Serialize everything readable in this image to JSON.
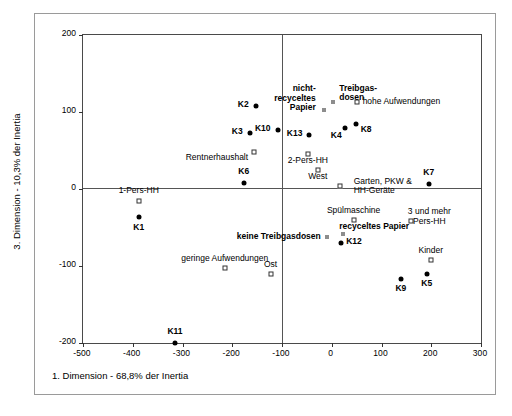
{
  "chart_data": {
    "type": "scatter",
    "title": "",
    "xlabel": "1. Dimension - 68,8% der Inertia",
    "ylabel": "3. Dimension - 10,3% der Inertia",
    "xlim": [
      -500,
      300
    ],
    "ylim": [
      -200,
      200
    ],
    "xticks": [
      -500,
      -400,
      -300,
      -200,
      -100,
      0,
      100,
      200,
      300
    ],
    "yticks": [
      200,
      100,
      0,
      -100,
      -200
    ],
    "xticklabels": [
      "-500",
      "-400",
      "-300",
      "-200",
      "-100",
      "0",
      "100",
      "200",
      "300"
    ],
    "yticklabels": [
      "200",
      "100",
      "0",
      "-100",
      "-200"
    ],
    "grid": false,
    "legend": null,
    "origin_lines": true,
    "series": [
      {
        "name": "Cluster",
        "marker": "filled-circle",
        "points": [
          {
            "label": "K1",
            "x": -388,
            "y": -37
          },
          {
            "label": "K11",
            "x": -315,
            "y": -200
          },
          {
            "label": "K6",
            "x": -177,
            "y": 8
          },
          {
            "label": "K3",
            "x": -165,
            "y": 73
          },
          {
            "label": "K2",
            "x": -153,
            "y": 108
          },
          {
            "label": "K10",
            "x": -109,
            "y": 77
          },
          {
            "label": "K13",
            "x": -45,
            "y": 70
          },
          {
            "label": "K4",
            "x": 26,
            "y": 79
          },
          {
            "label": "K8",
            "x": 48,
            "y": 84
          },
          {
            "label": "K7",
            "x": 195,
            "y": 7
          },
          {
            "label": "K12",
            "x": 19,
            "y": -70
          },
          {
            "label": "K9",
            "x": 139,
            "y": -117
          },
          {
            "label": "K5",
            "x": 191,
            "y": -110
          }
        ]
      },
      {
        "name": "Merkmal",
        "marker": "open-square",
        "points": [
          {
            "label": "1-Pers-HH",
            "x": -388,
            "y": -15
          },
          {
            "label": "Rentnerhaushalt",
            "x": -156,
            "y": 48
          },
          {
            "label": "2-Pers-HH",
            "x": -48,
            "y": 45
          },
          {
            "label": "West",
            "x": -28,
            "y": 25
          },
          {
            "label": "geringe Aufwendungen",
            "x": -215,
            "y": -103
          },
          {
            "label": "Ost",
            "x": -123,
            "y": -110
          },
          {
            "label": "Garten, PKW & HH-Geräte",
            "x": 16,
            "y": 4
          },
          {
            "label": "Spülmaschine",
            "x": 44,
            "y": -40
          },
          {
            "label": "3 und mehr Pers-HH",
            "x": 160,
            "y": -42
          },
          {
            "label": "Kinder",
            "x": 199,
            "y": -92
          },
          {
            "label": "hohe Aufwendungen",
            "x": 50,
            "y": 113
          }
        ]
      },
      {
        "name": "Produkt",
        "marker": "small-gray-square",
        "points": [
          {
            "label": "nicht-recyceltes Papier",
            "x": -16,
            "y": 102
          },
          {
            "label": "Treibgasdosen",
            "x": 3,
            "y": 113
          },
          {
            "label": "keine Treibgasdosen",
            "x": -10,
            "y": -62
          },
          {
            "label": "recyceltes Papier",
            "x": 23,
            "y": -58
          }
        ]
      }
    ]
  },
  "axes": {
    "x_title": "1. Dimension - 68,8% der Inertia",
    "y_title": "3. Dimension - 10,3% der Inertia"
  },
  "labels": {
    "k1": "K1",
    "k2": "K2",
    "k3": "K3",
    "k4": "K4",
    "k5": "K5",
    "k6": "K6",
    "k7": "K7",
    "k8": "K8",
    "k9": "K9",
    "k10": "K10",
    "k11": "K11",
    "k12": "K12",
    "k13": "K13",
    "pers1": "1-Pers-HH",
    "rentner": "Rentnerhaushalt",
    "pers2": "2-Pers-HH",
    "west": "West",
    "ost": "Ost",
    "geringe": "geringe Aufwendungen",
    "hohe": "hohe Aufwendungen",
    "garten1": "Garten, PKW &",
    "garten2": "HH-Geräte",
    "spuel": "Spülmaschine",
    "pers3a": "3 und mehr",
    "pers3b": "Pers-HH",
    "kinder": "Kinder",
    "nicht1": "nicht-",
    "nicht2": "recyceltes",
    "nicht3": "Papier",
    "treib1": "Treibgas-",
    "treib2": "dosen",
    "keinetreib": "keine Treibgasdosen",
    "recyc": "recyceltes Papier"
  },
  "ticks": {
    "x": [
      "-500",
      "-400",
      "-300",
      "-200",
      "-100",
      "0",
      "100",
      "200",
      "300"
    ],
    "y": [
      "200",
      "100",
      "0",
      "-100",
      "-200"
    ]
  },
  "colors": {
    "marker": "#000000",
    "frame": "#4a4a4a",
    "outer": "#9a9a9a",
    "gray_marker": "#8d8d8d"
  }
}
